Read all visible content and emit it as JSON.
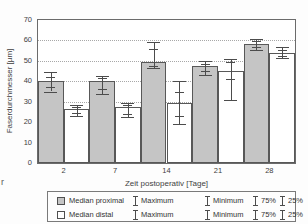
{
  "page": {
    "edge_fragment": "r"
  },
  "chart_data": {
    "type": "bar",
    "title": "",
    "xlabel": "Zeit postoperativ [Tage]",
    "ylabel": "Faserdurchmesser [µm]",
    "ylim": [
      0,
      70
    ],
    "yticks": [
      0,
      10,
      20,
      30,
      40,
      50,
      60,
      70
    ],
    "gridlines_at": [
      30,
      40,
      50,
      60
    ],
    "grid": "dotted-horizontal",
    "legend_position": "bottom",
    "categories": [
      2,
      7,
      14,
      21,
      28
    ],
    "series": [
      {
        "name": "Median proximal",
        "fill": "#c5c5c5",
        "values": [
          40,
          40,
          49.5,
          47.5,
          58.5
        ],
        "max": [
          44.5,
          42.5,
          59,
          50,
          60.5
        ],
        "p75": [
          42,
          41.5,
          56,
          48.5,
          59.5
        ],
        "p25": [
          37,
          36,
          47.5,
          45,
          57
        ],
        "min": [
          35,
          34,
          46.5,
          43,
          55.5
        ]
      },
      {
        "name": "Median distal",
        "fill": "#ffffff",
        "values": [
          26.5,
          27.5,
          29.5,
          45,
          54
        ],
        "max": [
          28.5,
          29.5,
          40,
          51,
          57
        ],
        "p75": [
          27.5,
          28.5,
          35,
          49.5,
          55.5
        ],
        "p25": [
          24.5,
          24,
          23,
          41,
          52.5
        ],
        "min": [
          23,
          22.5,
          19,
          31,
          51.5
        ]
      }
    ]
  },
  "legend": {
    "rows": [
      {
        "swatch": "proximal",
        "label": "Median proximal",
        "maximum": "Maximum",
        "minimum": "Minimum",
        "p75": "75%",
        "p25": "25%"
      },
      {
        "swatch": "distal",
        "label": "Median distal",
        "maximum": "Maximum",
        "minimum": "Minimum",
        "p75": "75%",
        "p25": "25%"
      }
    ]
  },
  "colors": {
    "bar_proximal": "#c5c5c5",
    "bar_distal": "#ffffff",
    "bar_border": "#585858",
    "whisker": "#4c4c4c",
    "frame": "#6b6b6b",
    "gridline": "#a8a8a8",
    "text": "#3a3a3a"
  }
}
